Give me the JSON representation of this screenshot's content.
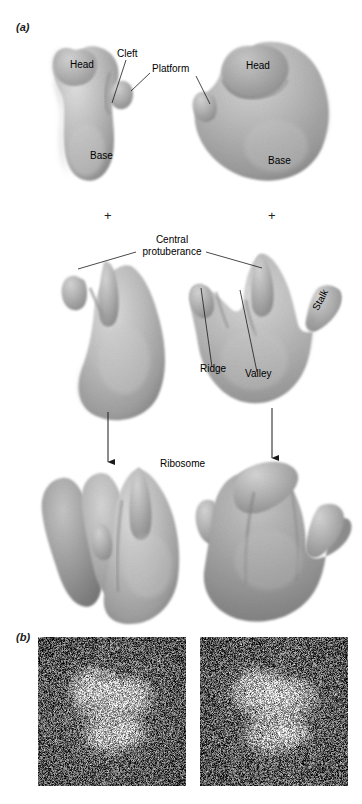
{
  "figure": {
    "panels": [
      {
        "id": "a",
        "letter": "(a)"
      },
      {
        "id": "b",
        "letter": "(b)"
      }
    ]
  },
  "panel_a": {
    "letter": "(a)",
    "small_subunit": {
      "labels": [
        {
          "name": "head-left",
          "text": "Head"
        },
        {
          "name": "cleft",
          "text": "Cleft"
        },
        {
          "name": "platform",
          "text": "Platform"
        },
        {
          "name": "base-left",
          "text": "Base"
        },
        {
          "name": "head-right",
          "text": "Head"
        },
        {
          "name": "base-right",
          "text": "Base"
        }
      ]
    },
    "operators": [
      {
        "name": "plus-left",
        "text": "+"
      },
      {
        "name": "plus-right",
        "text": "+"
      }
    ],
    "large_subunit": {
      "labels": [
        {
          "name": "central-protuberance-line1",
          "text": "Central"
        },
        {
          "name": "central-protuberance-line2",
          "text": "protuberance"
        },
        {
          "name": "ridge",
          "text": "Ridge"
        },
        {
          "name": "valley",
          "text": "Valley"
        },
        {
          "name": "stalk",
          "text": "Stalk"
        }
      ]
    },
    "assembly": {
      "label": "Ribosome"
    }
  },
  "panel_b": {
    "letter": "(b)",
    "micrographs": [
      {
        "name": "micrograph-left",
        "seed": 1347
      },
      {
        "name": "micrograph-right",
        "seed": 8821
      }
    ]
  },
  "colors": {
    "body_light": "#d2d2d2",
    "body_mid": "#b4b4b4",
    "body_dark": "#8f8f8f",
    "body_shadow": "#6f6f6f",
    "text": "#000000",
    "leader": "#1a1a1a",
    "background": "#ffffff"
  }
}
